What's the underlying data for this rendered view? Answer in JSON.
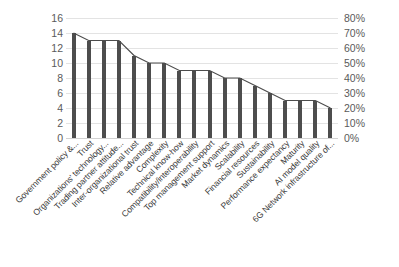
{
  "chart_data": {
    "type": "bar",
    "title": "",
    "subtitle": "",
    "xlabel": "",
    "ylabel": "",
    "categories": [
      "Government policy &...",
      "Trust",
      "Organizations' technology...",
      "Trading partner attitude...",
      "Inter-organizational trust",
      "Relative advantage",
      "Complexity",
      "Technical know-how",
      "Compatibility/interoperability",
      "Top management support",
      "Market dynamics",
      "Scalability",
      "Financial resources",
      "Sustainability",
      "Performance expectancy",
      "Maturity",
      "AI model quality",
      "6G Network infrastructure of..."
    ],
    "values": [
      14,
      13,
      13,
      13,
      11,
      10,
      10,
      9,
      9,
      9,
      8,
      8,
      7,
      6,
      5,
      5,
      5,
      4
    ],
    "series": [
      {
        "name": "Frequency",
        "values": [
          14,
          13,
          13,
          13,
          11,
          10,
          10,
          9,
          9,
          9,
          8,
          8,
          7,
          6,
          5,
          5,
          5,
          4
        ]
      }
    ],
    "ylim": [
      0,
      16
    ],
    "y_ticks": [
      0,
      2,
      4,
      6,
      8,
      10,
      12,
      14,
      16
    ],
    "y_tick_labels": [
      "0",
      "2",
      "4",
      "6",
      "8",
      "10",
      "12",
      "14",
      "16"
    ],
    "y2lim": [
      0,
      80
    ],
    "y2_ticks": [
      0,
      10,
      20,
      30,
      40,
      50,
      60,
      70,
      80
    ],
    "y2_tick_labels": [
      "0%",
      "10%",
      "20%",
      "30%",
      "40%",
      "50%",
      "60%",
      "70%",
      "80%"
    ],
    "grid": true,
    "legend": "none",
    "bar_color": "#4d4d4d",
    "grid_color": "#e3e3e3",
    "tick_color": "#5a5a5a"
  }
}
